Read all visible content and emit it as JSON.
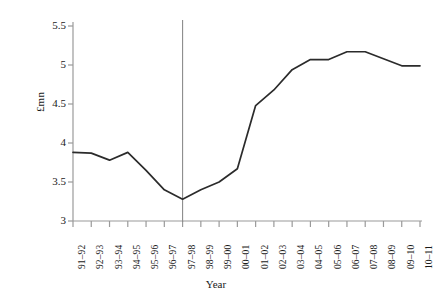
{
  "chart_data": {
    "type": "line",
    "title": "",
    "xlabel": "Year",
    "ylabel": "£mn",
    "ylim": [
      3,
      5.5
    ],
    "yticks": [
      3,
      3.5,
      4,
      4.5,
      5,
      5.5
    ],
    "ytick_labels": [
      "3",
      "3.5",
      "4",
      "4.5",
      "5",
      "5.5"
    ],
    "grid": false,
    "legend": "none",
    "categories": [
      "91–92",
      "92–93",
      "93–94",
      "94–95",
      "95–96",
      "96–97",
      "97–98",
      "98–99",
      "99–00",
      "00–01",
      "01–02",
      "02–03",
      "03–04",
      "04–05",
      "05–06",
      "06–07",
      "07–08",
      "08–09",
      "09–10",
      "10–11"
    ],
    "values": [
      3.88,
      3.87,
      3.78,
      3.88,
      3.65,
      3.4,
      3.28,
      3.4,
      3.5,
      3.67,
      4.48,
      4.68,
      4.94,
      5.07,
      5.07,
      5.17,
      5.17,
      5.08,
      4.99,
      4.99
    ],
    "annotations": [
      {
        "name": "vertical-reference-line",
        "type": "vline",
        "at_category": "97–98",
        "label": ""
      }
    ],
    "series_color": "#2b2b2b",
    "axis_color": "#9a9a9a",
    "vline_color": "#8c8c8c"
  }
}
